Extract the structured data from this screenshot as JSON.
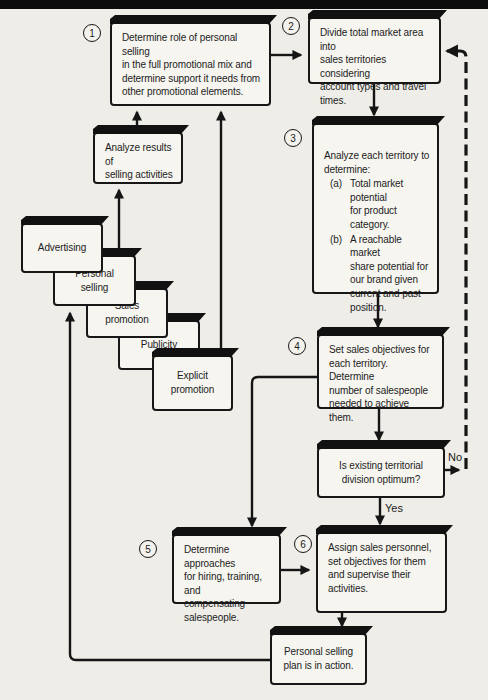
{
  "diagram": {
    "kind": "flowchart",
    "topic": "Personal selling planning process"
  },
  "steps": [
    {
      "number": "1",
      "text": "Determine role of personal selling\nin the full promotional mix and\ndetermine support it needs from\nother promotional elements."
    },
    {
      "number": "2",
      "text": "Divide total market area into\nsales territories considering\naccount types and travel\ntimes."
    },
    {
      "number": "3",
      "intro": "Analyze each territory to\ndetermine:",
      "items": [
        {
          "label": "(a)",
          "text": "Total market potential\nfor product category."
        },
        {
          "label": "(b)",
          "text": "A reachable market\nshare potential for\nour brand given\ncurrent and past\nposition."
        }
      ]
    },
    {
      "number": "4",
      "text": "Set sales objectives for\neach territory. Determine\nnumber of salespeople\nneeded to achieve them."
    },
    {
      "number": "5",
      "text": "Determine approaches\nfor hiring, training, and\ncompensating\nsalespeople."
    },
    {
      "number": "6",
      "text": "Assign sales personnel,\nset objectives for them\nand supervise their\nactivities."
    }
  ],
  "decision": {
    "text": "Is existing territorial\ndivision optimum?",
    "yes_label": "Yes",
    "no_label": "No"
  },
  "analyze_box": {
    "text": "Analyze results of\nselling activities"
  },
  "plan_box": {
    "text": "Personal selling\nplan is in action."
  },
  "promo_cascade": [
    {
      "label": "Advertising"
    },
    {
      "label": "Personal\nselling"
    },
    {
      "label": "Sales\npromotion"
    },
    {
      "label": "Publicity"
    },
    {
      "label": "Explicit\npromotion"
    }
  ],
  "colors": {
    "page_bg": "#eeede8",
    "box_fill": "#f6f5f0",
    "line": "#151515",
    "top_rule": "#0c0c0c"
  }
}
